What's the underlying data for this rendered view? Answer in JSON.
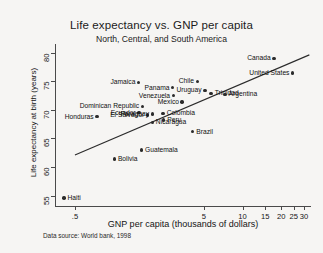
{
  "chart_data": {
    "type": "scatter",
    "title": "Life expectancy vs. GNP per capita",
    "subtitle": "North, Central, and South America",
    "xlabel": "GNP per capita (thousands of dollars)",
    "ylabel": "Life expectancy at birth (years)",
    "note": "Data source:  World bank, 1998",
    "xscale": "log",
    "xlim": [
      0.35,
      34
    ],
    "ylim": [
      53.2,
      81.5
    ],
    "xticks": [
      ".5",
      "5",
      "10",
      "15",
      "20",
      "25",
      "30"
    ],
    "xtick_values": [
      0.5,
      5,
      10,
      15,
      20,
      25,
      30
    ],
    "yticks": [
      "55",
      "60",
      "65",
      "70",
      "75",
      "80"
    ],
    "ytick_values": [
      55,
      60,
      65,
      70,
      75,
      80
    ],
    "grid": false,
    "legend": "none",
    "marker_color": "#2b2b2b",
    "fit_line": {
      "type": "linear-on-log-x",
      "x_start": 0.5,
      "y_start": 62.1,
      "x_end": 33.0,
      "y_end": 79.6
    },
    "points": [
      {
        "name": "Haiti",
        "x": 0.41,
        "y": 54.6,
        "label_side": "right"
      },
      {
        "name": "Honduras",
        "x": 0.74,
        "y": 68.8,
        "label_side": "left"
      },
      {
        "name": "Bolivia",
        "x": 1.01,
        "y": 61.4,
        "label_side": "right"
      },
      {
        "name": "Dominican Republic",
        "x": 1.67,
        "y": 70.6,
        "label_side": "left"
      },
      {
        "name": "Ecuador",
        "x": 1.57,
        "y": 69.5,
        "label_side": "left"
      },
      {
        "name": "El Salvador",
        "x": 1.83,
        "y": 69.1,
        "label_side": "left"
      },
      {
        "name": "Jamaica",
        "x": 1.56,
        "y": 74.8,
        "label_side": "left"
      },
      {
        "name": "Guatemala",
        "x": 1.64,
        "y": 63.0,
        "label_side": "right"
      },
      {
        "name": "Paraguay",
        "x": 1.99,
        "y": 69.3,
        "label_side": "left"
      },
      {
        "name": "Nicaragua",
        "x": 1.99,
        "y": 67.8,
        "label_side": "right"
      },
      {
        "name": "Peru",
        "x": 2.44,
        "y": 68.2,
        "label_side": "right"
      },
      {
        "name": "Colombia",
        "x": 2.42,
        "y": 69.4,
        "label_side": "right"
      },
      {
        "name": "Panama",
        "x": 2.87,
        "y": 73.9,
        "label_side": "left"
      },
      {
        "name": "Venezuela",
        "x": 2.9,
        "y": 72.5,
        "label_side": "left"
      },
      {
        "name": "Mexico",
        "x": 3.4,
        "y": 71.4,
        "label_side": "left"
      },
      {
        "name": "Brazil",
        "x": 4.1,
        "y": 66.2,
        "label_side": "right"
      },
      {
        "name": "Chile",
        "x": 4.45,
        "y": 75.0,
        "label_side": "left"
      },
      {
        "name": "Uruguay",
        "x": 5.1,
        "y": 73.4,
        "label_side": "left"
      },
      {
        "name": "Trinidad",
        "x": 5.7,
        "y": 72.9,
        "label_side": "right"
      },
      {
        "name": "Argentina",
        "x": 7.3,
        "y": 72.7,
        "label_side": "right"
      },
      {
        "name": "Canada",
        "x": 17.5,
        "y": 79.0,
        "label_side": "left"
      },
      {
        "name": "United States",
        "x": 24.5,
        "y": 76.4,
        "label_side": "left"
      }
    ]
  }
}
